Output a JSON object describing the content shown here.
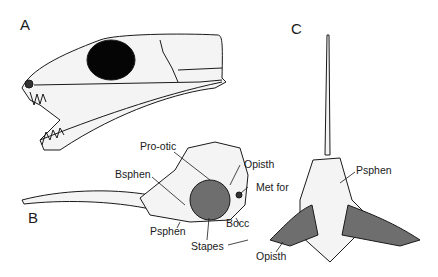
{
  "figure": {
    "panels": [
      {
        "id": "A",
        "label": "A",
        "description": "skull lateral view"
      },
      {
        "id": "B",
        "label": "B",
        "description": "braincase lateral view"
      },
      {
        "id": "C",
        "label": "C",
        "description": "braincase dorsal/ventral view"
      }
    ],
    "annotations": {
      "b_prootic": "Pro-otic",
      "b_opisth": "Opisth",
      "b_bsphen": "Bsphen",
      "b_metfor": "Met for",
      "b_bocc": "Bocc",
      "b_psphen": "Psphen",
      "b_stapes": "Stapes",
      "c_psphen": "Psphen",
      "c_opisth": "Opisth"
    },
    "colors": {
      "line": "#1a1a1a",
      "fill": "#f4f4f4",
      "stapes": "#6e6e6e",
      "orbit": "#050505"
    }
  }
}
